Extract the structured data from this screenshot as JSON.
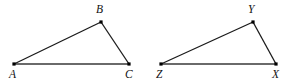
{
  "figure": {
    "name": "two-triangles-diagram",
    "type": "geometry-diagram",
    "canvas": {
      "width": 292,
      "height": 82
    },
    "background_color": "#ffffff",
    "style": {
      "side_color": "#1a1a1a",
      "base_color": "#6a6a6a",
      "vertex_dot_color": "#000000",
      "label_color": "#111111",
      "side_width": 1.3,
      "base_width": 2.0,
      "vertex_dot_size": 3.2,
      "label_font_size": 11.5
    },
    "triangles": [
      {
        "id": "triangle-abc",
        "name": "triangle-abc",
        "vertices": [
          {
            "label": "A",
            "x": 14,
            "y": 64,
            "label_x": 9,
            "label_y": 78,
            "label_name": "vertex-label-a"
          },
          {
            "label": "B",
            "x": 101,
            "y": 22,
            "label_x": 96,
            "label_y": 13,
            "label_name": "vertex-label-b"
          },
          {
            "label": "C",
            "x": 129,
            "y": 64,
            "label_x": 125,
            "label_y": 78,
            "label_name": "vertex-label-c"
          }
        ],
        "edges": [
          {
            "from": "A",
            "to": "B",
            "name": "edge-ab",
            "kind": "side"
          },
          {
            "from": "B",
            "to": "C",
            "name": "edge-bc",
            "kind": "side"
          },
          {
            "from": "A",
            "to": "C",
            "name": "edge-ac",
            "kind": "base"
          }
        ]
      },
      {
        "id": "triangle-zyx",
        "name": "triangle-zyx",
        "vertices": [
          {
            "label": "Z",
            "x": 161,
            "y": 64,
            "label_x": 156,
            "label_y": 78,
            "label_name": "vertex-label-z"
          },
          {
            "label": "Y",
            "x": 253,
            "y": 22,
            "label_x": 248,
            "label_y": 13,
            "label_name": "vertex-label-y"
          },
          {
            "label": "X",
            "x": 276,
            "y": 64,
            "label_x": 272,
            "label_y": 78,
            "label_name": "vertex-label-x"
          }
        ],
        "edges": [
          {
            "from": "Z",
            "to": "Y",
            "name": "edge-zy",
            "kind": "side"
          },
          {
            "from": "Y",
            "to": "X",
            "name": "edge-yx",
            "kind": "side"
          },
          {
            "from": "Z",
            "to": "X",
            "name": "edge-zx",
            "kind": "base"
          }
        ]
      }
    ]
  }
}
